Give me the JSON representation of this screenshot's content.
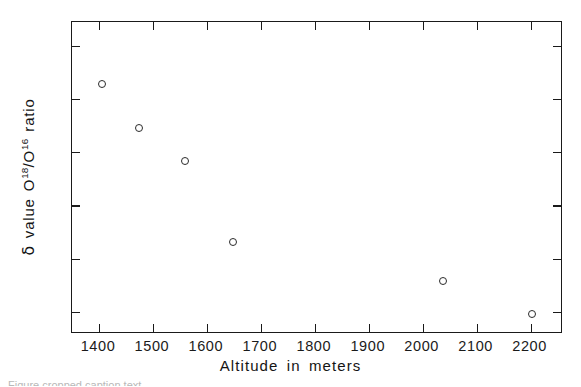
{
  "chart_data": {
    "type": "scatter",
    "title": "",
    "xlabel": "Altitude in meters",
    "ylabel_text": "δ value O18/O16 ratio",
    "ylabel_parts": {
      "delta": "δ",
      "value": "value",
      "o_first": "O",
      "sup_first": "18",
      "slash": "/",
      "o_second": "O",
      "sup_second": "16",
      "ratio": "ratio"
    },
    "xlim": [
      1350,
      2260
    ],
    "ylim": [
      -13.42,
      -7.55
    ],
    "xticks": [
      1400,
      1500,
      1600,
      1700,
      1800,
      1900,
      2000,
      2100,
      2200
    ],
    "xtick_labels": [
      "1400",
      "1500",
      "1600",
      "1700",
      "1800",
      "1900",
      "2000",
      "2100",
      "2200"
    ],
    "yticks": [
      -8,
      -9,
      -10,
      -11,
      -12,
      -13
    ],
    "ytick_labels": [
      "-8",
      "-9",
      "-10",
      "-11",
      "-12",
      "-13"
    ],
    "grid": false,
    "legend": null,
    "marker": "open-circle",
    "marker_color": "#2b2b2b",
    "x": [
      1405,
      1474,
      1559,
      1648,
      2037,
      2202
    ],
    "y": [
      -8.72,
      -9.54,
      -10.16,
      -11.68,
      -12.43,
      -13.05
    ],
    "points": [
      {
        "x": 1405,
        "y": -8.72
      },
      {
        "x": 1474,
        "y": -9.54
      },
      {
        "x": 1559,
        "y": -10.16
      },
      {
        "x": 1648,
        "y": -11.68
      },
      {
        "x": 2037,
        "y": -12.43
      },
      {
        "x": 2202,
        "y": -13.05
      }
    ]
  },
  "caption": {
    "sliver_text": "Figure  cropped caption text"
  }
}
